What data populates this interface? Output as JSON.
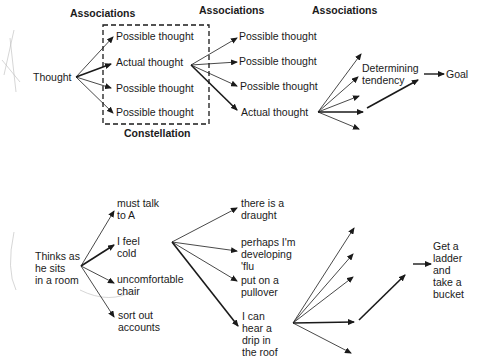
{
  "top_diagram": {
    "headers": [
      "Associations",
      "Associations",
      "Associations"
    ],
    "root": "Thought",
    "constellation_label": "Constellation",
    "level1": [
      "Possible thought",
      "Actual thought",
      "Possible thought",
      "Possible thought"
    ],
    "level2": [
      "Possible thought",
      "Possible thought",
      "Possible thought",
      "Actual thought"
    ],
    "determining_tendency": "Determining\ntendency",
    "goal": "Goal"
  },
  "bottom_diagram": {
    "root": "Thinks as\nhe sits\nin a room",
    "level1": [
      "must talk\nto A",
      "I feel\ncold",
      "uncomfortable\nchair",
      "sort out\naccounts"
    ],
    "level2": [
      "there is a\ndraught",
      "perhaps I'm\ndeveloping\n'flu",
      "put on a\npullover",
      "I can\nhear a\ndrip in\nthe roof"
    ],
    "outcome": "Get a\nladder\nand\ntake a\nbucket"
  },
  "colors": {
    "ink": "#1a1a1a",
    "background": "#ffffff"
  }
}
